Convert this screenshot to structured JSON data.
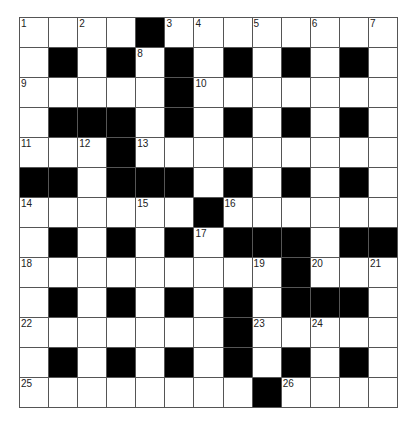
{
  "puzzle": {
    "rows": 13,
    "cols": 13,
    "layout": [
      ".... ........",
      ".#.#.#.#.#.#.",
      ".....#.......",
      ".###.#.#.#.#.",
      "...#.........",
      "##.###.#.#.#.",
      "......#......",
      ".#.#.#.###.##",
      ".........#...",
      ".#.#.#.#.###.",
      ".......#.....",
      ".#.#.#.#.#.#.",
      "........#...."
    ],
    "numbers": [
      {
        "r": 0,
        "c": 0,
        "n": "1"
      },
      {
        "r": 0,
        "c": 2,
        "n": "2"
      },
      {
        "r": 0,
        "c": 5,
        "n": "3"
      },
      {
        "r": 0,
        "c": 6,
        "n": "4"
      },
      {
        "r": 0,
        "c": 8,
        "n": "5"
      },
      {
        "r": 0,
        "c": 10,
        "n": "6"
      },
      {
        "r": 0,
        "c": 12,
        "n": "7"
      },
      {
        "r": 1,
        "c": 4,
        "n": "8"
      },
      {
        "r": 2,
        "c": 0,
        "n": "9"
      },
      {
        "r": 2,
        "c": 6,
        "n": "10"
      },
      {
        "r": 4,
        "c": 0,
        "n": "11"
      },
      {
        "r": 4,
        "c": 2,
        "n": "12"
      },
      {
        "r": 4,
        "c": 4,
        "n": "13"
      },
      {
        "r": 6,
        "c": 0,
        "n": "14"
      },
      {
        "r": 6,
        "c": 4,
        "n": "15"
      },
      {
        "r": 6,
        "c": 7,
        "n": "16"
      },
      {
        "r": 7,
        "c": 6,
        "n": "17"
      },
      {
        "r": 8,
        "c": 0,
        "n": "18"
      },
      {
        "r": 8,
        "c": 8,
        "n": "19"
      },
      {
        "r": 8,
        "c": 10,
        "n": "20"
      },
      {
        "r": 8,
        "c": 12,
        "n": "21"
      },
      {
        "r": 10,
        "c": 0,
        "n": "22"
      },
      {
        "r": 10,
        "c": 8,
        "n": "23"
      },
      {
        "r": 10,
        "c": 10,
        "n": "24"
      },
      {
        "r": 12,
        "c": 0,
        "n": "25"
      },
      {
        "r": 12,
        "c": 9,
        "n": "26"
      }
    ]
  }
}
